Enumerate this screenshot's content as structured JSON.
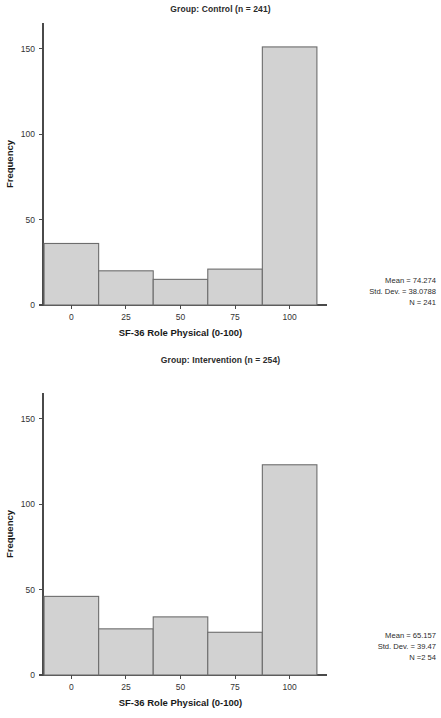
{
  "page": {
    "width": 441,
    "height": 718,
    "background": "#ffffff",
    "bar_fill": "#d2d2d2",
    "bar_stroke": "#6d6d6d",
    "axis_color": "#4a4a4a"
  },
  "panels": [
    {
      "id": "control",
      "title": "Group: Control (n = 241)",
      "stats": {
        "mean_line": "Mean = 74.274",
        "std_line": "Std. Dev. = 38.0788",
        "n_line": "N = 241"
      }
    },
    {
      "id": "intervention",
      "title": "Group: Intervention (n = 254)",
      "stats": {
        "mean_line": "Mean = 65.157",
        "std_line": "Std. Dev. = 39.47",
        "n_line": "N =2 54"
      }
    }
  ],
  "chart_data": [
    {
      "type": "bar",
      "title": "Group: Control (n = 241)",
      "xlabel": "SF-36 Role Physical (0-100)",
      "ylabel": "Frequency",
      "categories": [
        "0",
        "25",
        "50",
        "75",
        "100"
      ],
      "bin_centers": [
        0,
        25,
        50,
        75,
        100
      ],
      "values": [
        36,
        20,
        15,
        21,
        151
      ],
      "xticks": [
        "0",
        "25",
        "50",
        "75",
        "100"
      ],
      "yticks": [
        "0",
        "50",
        "100",
        "150"
      ],
      "ytick_values": [
        0,
        50,
        100,
        150
      ],
      "ylim": [
        0,
        165
      ],
      "xlim": [
        -13,
        113
      ],
      "grid": false,
      "legend": false,
      "annotations": [
        "Mean = 74.274",
        "Std. Dev. = 38.0788",
        "N = 241"
      ],
      "stats": {
        "mean": 74.274,
        "std_dev": 38.0788,
        "n": 241
      }
    },
    {
      "type": "bar",
      "title": "Group: Intervention (n = 254)",
      "xlabel": "SF-36 Role Physical (0-100)",
      "ylabel": "Frequency",
      "categories": [
        "0",
        "25",
        "50",
        "75",
        "100"
      ],
      "bin_centers": [
        0,
        25,
        50,
        75,
        100
      ],
      "values": [
        46,
        27,
        34,
        25,
        123
      ],
      "xticks": [
        "0",
        "25",
        "50",
        "75",
        "100"
      ],
      "yticks": [
        "0",
        "50",
        "100",
        "150"
      ],
      "ytick_values": [
        0,
        50,
        100,
        150
      ],
      "ylim": [
        0,
        165
      ],
      "xlim": [
        -13,
        113
      ],
      "grid": false,
      "legend": false,
      "annotations": [
        "Mean = 65.157",
        "Std. Dev. = 39.47",
        "N =2 54"
      ],
      "stats": {
        "mean": 65.157,
        "std_dev": 39.47,
        "n": 254
      }
    }
  ]
}
